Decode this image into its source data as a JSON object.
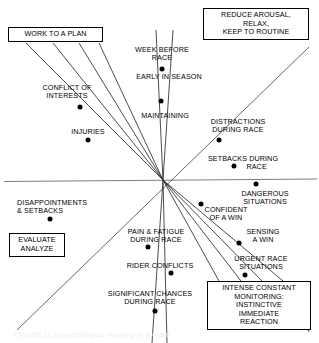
{
  "figure": {
    "type": "scatter-quadrant-diagram",
    "caption": "FIGURE 11 A psychological mapping of arousal",
    "center": {
      "x": 163,
      "y": 180
    },
    "axes": {
      "horizontal": {
        "x1": 4,
        "y1": 181,
        "x2": 317,
        "y2": 179
      },
      "diagonal_main": {
        "x1": 18,
        "y1": 330,
        "x2": 308,
        "y2": 48
      }
    },
    "boxes": [
      {
        "id": "work-to-a-plan",
        "text": "WORK TO A PLAN",
        "x": 8,
        "y": 27,
        "w": 95,
        "h": 15
      },
      {
        "id": "reduce-arousal",
        "text": "REDUCE AROUSAL,\nRELAX,\nKEEP TO ROUTINE",
        "x": 203,
        "y": 8,
        "w": 106,
        "h": 33
      },
      {
        "id": "evaluate-analyze",
        "text": "EVALUATE\nANALYZE",
        "x": 9,
        "y": 233,
        "w": 56,
        "h": 23
      },
      {
        "id": "intense-constant-monitoring",
        "text": "INTENSE CONSTANT\nMONITORING:\nINSTINCTIVE\nIMMEDIATE\nREACTION",
        "x": 207,
        "y": 281,
        "w": 104,
        "h": 49
      }
    ],
    "points": [
      {
        "id": "week-before-race",
        "label": "WEEK BEFORE\nRACE",
        "lx": 162,
        "ly": 46,
        "align": "center",
        "dx": 162,
        "dy": 69
      },
      {
        "id": "early-in-season",
        "label": "EARLY IN SEASON",
        "lx": 169,
        "ly": 73,
        "align": "center",
        "dx": null,
        "dy": null
      },
      {
        "id": "maintaining",
        "label": "MAINTAINING",
        "lx": 165,
        "ly": 112,
        "align": "center",
        "dx": 161,
        "dy": 101
      },
      {
        "id": "conflict-of-interests",
        "label": "CONFLICT OF\nINTERESTS",
        "lx": 67,
        "ly": 84,
        "align": "center",
        "dx": 80,
        "dy": 107
      },
      {
        "id": "injuries",
        "label": "INJURIES",
        "lx": 88,
        "ly": 128,
        "align": "center",
        "dx": 88,
        "dy": 140
      },
      {
        "id": "distractions-during-race",
        "label": "DISTRACTIONS\nDURING RACE",
        "lx": 238,
        "ly": 118,
        "align": "center",
        "dx": 219,
        "dy": 140
      },
      {
        "id": "setbacks-during-race",
        "label": "SETBACKS DURING\n             RACE",
        "lx": 243,
        "ly": 155,
        "align": "center",
        "dx": 234,
        "dy": 166
      },
      {
        "id": "dangerous-situations",
        "label": "DANGEROUS\nSITUATIONS",
        "lx": 265,
        "ly": 190,
        "align": "center",
        "dx": 256,
        "dy": 184
      },
      {
        "id": "confident-of-a-win",
        "label": "CONFIDENT\nOF A WIN",
        "lx": 226,
        "ly": 206,
        "align": "center",
        "dx": 201,
        "dy": 204
      },
      {
        "id": "sensing-a-win",
        "label": "SENSING\nA WIN",
        "lx": 263,
        "ly": 228,
        "align": "center",
        "dx": 239,
        "dy": 243
      },
      {
        "id": "urgent-race-situations",
        "label": "URGENT RACE\nSITUATIONS",
        "lx": 261,
        "ly": 255,
        "align": "center",
        "dx": 245,
        "dy": 275
      },
      {
        "id": "disappointments-setbacks",
        "label": "DISAPPOINTMENTS\n& SETBACKS",
        "lx": 17,
        "ly": 199,
        "align": "left",
        "dx": 50,
        "dy": 219
      },
      {
        "id": "pain-fatigue-during-race",
        "label": "PAIN & FATIGUE\nDURING RACE",
        "lx": 156,
        "ly": 228,
        "align": "center",
        "dx": 148,
        "dy": 247
      },
      {
        "id": "rider-conflicts",
        "label": "RIDER CONFLICTS",
        "lx": 160,
        "ly": 262,
        "align": "center",
        "dx": 171,
        "dy": 273
      },
      {
        "id": "significant-chances",
        "label": "SIGNIFICANT CHANCES\nDURING RACE",
        "lx": 150,
        "ly": 290,
        "align": "center",
        "dx": 155,
        "dy": 311
      }
    ]
  }
}
